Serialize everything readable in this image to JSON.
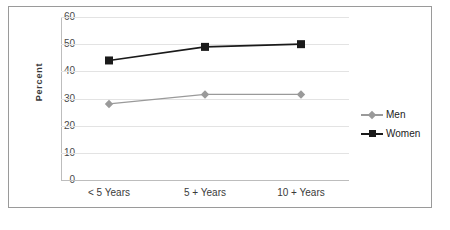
{
  "chart_data": {
    "type": "line",
    "title": "",
    "subtitle": "",
    "xlabel": "",
    "ylabel": "Percent",
    "categories": [
      "< 5 Years",
      "5 + Years",
      "10 + Years"
    ],
    "series": [
      {
        "name": "Men",
        "values": [
          28,
          31.5,
          31.5
        ],
        "color": "#9a9a9a",
        "marker": "diamond"
      },
      {
        "name": "Women",
        "values": [
          44,
          49,
          50
        ],
        "color": "#1a1a1a",
        "marker": "square"
      }
    ],
    "ylim": [
      0,
      60
    ],
    "yticks": [
      0,
      10,
      20,
      30,
      40,
      50,
      60
    ],
    "ytick_labels": [
      "0",
      "10",
      "20",
      "30",
      "40",
      "50",
      "60"
    ],
    "grid": "horizontal",
    "legend_position": "right"
  },
  "legend": {
    "entries": [
      {
        "label": "Men"
      },
      {
        "label": "Women"
      }
    ]
  },
  "axis": {
    "y_label": "Percent",
    "y_ticks": [
      "60",
      "50",
      "40",
      "30",
      "20",
      "10",
      "0"
    ],
    "x_ticks": [
      "< 5 Years",
      "5 + Years",
      "10 + Years"
    ]
  }
}
